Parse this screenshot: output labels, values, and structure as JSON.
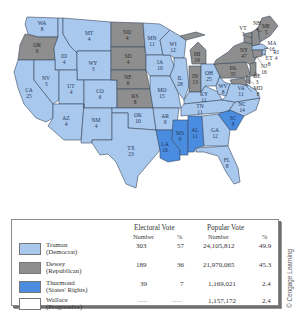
{
  "colors": {
    "truman": "#a8c8ee",
    "dewey": "#8e8e8e",
    "thurmond": "#4a8ce0",
    "wallace": "#ffffff",
    "border": "#3a4a5e"
  },
  "states": [
    {
      "abbr": "WA",
      "ev": "8",
      "party": "truman"
    },
    {
      "abbr": "OR",
      "ev": "6",
      "party": "dewey"
    },
    {
      "abbr": "CA",
      "ev": "25",
      "party": "truman"
    },
    {
      "abbr": "ID",
      "ev": "4",
      "party": "truman"
    },
    {
      "abbr": "NV",
      "ev": "3",
      "party": "truman"
    },
    {
      "abbr": "MT",
      "ev": "4",
      "party": "truman"
    },
    {
      "abbr": "WY",
      "ev": "3",
      "party": "truman"
    },
    {
      "abbr": "UT",
      "ev": "4",
      "party": "truman"
    },
    {
      "abbr": "AZ",
      "ev": "4",
      "party": "truman"
    },
    {
      "abbr": "CO",
      "ev": "6",
      "party": "truman"
    },
    {
      "abbr": "NM",
      "ev": "4",
      "party": "truman"
    },
    {
      "abbr": "ND",
      "ev": "4",
      "party": "dewey"
    },
    {
      "abbr": "SD",
      "ev": "4",
      "party": "dewey"
    },
    {
      "abbr": "NE",
      "ev": "6",
      "party": "dewey"
    },
    {
      "abbr": "KS",
      "ev": "8",
      "party": "dewey"
    },
    {
      "abbr": "OK",
      "ev": "10",
      "party": "truman"
    },
    {
      "abbr": "TX",
      "ev": "23",
      "party": "truman"
    },
    {
      "abbr": "MN",
      "ev": "11",
      "party": "truman"
    },
    {
      "abbr": "IA",
      "ev": "10",
      "party": "truman"
    },
    {
      "abbr": "MO",
      "ev": "15",
      "party": "truman"
    },
    {
      "abbr": "AR",
      "ev": "9",
      "party": "truman"
    },
    {
      "abbr": "LA",
      "ev": "10",
      "party": "thurmond"
    },
    {
      "abbr": "WI",
      "ev": "12",
      "party": "truman"
    },
    {
      "abbr": "IL",
      "ev": "28",
      "party": "truman"
    },
    {
      "abbr": "MS",
      "ev": "9",
      "party": "thurmond"
    },
    {
      "abbr": "MI",
      "ev": "19",
      "party": "dewey"
    },
    {
      "abbr": "IN",
      "ev": "13",
      "party": "dewey"
    },
    {
      "abbr": "KY",
      "ev": "11",
      "party": "truman"
    },
    {
      "abbr": "TN",
      "ev": "11",
      "party": "truman"
    },
    {
      "abbr": "AL",
      "ev": "11",
      "party": "thurmond"
    },
    {
      "abbr": "OH",
      "ev": "25",
      "party": "truman"
    },
    {
      "abbr": "WV",
      "ev": "8",
      "party": "truman"
    },
    {
      "abbr": "GA",
      "ev": "12",
      "party": "truman"
    },
    {
      "abbr": "FL",
      "ev": "8",
      "party": "truman"
    },
    {
      "abbr": "SC",
      "ev": "8",
      "party": "thurmond"
    },
    {
      "abbr": "NC",
      "ev": "14",
      "party": "truman"
    },
    {
      "abbr": "VA",
      "ev": "11",
      "party": "truman"
    },
    {
      "abbr": "PA",
      "ev": "35",
      "party": "dewey"
    },
    {
      "abbr": "NY",
      "ev": "47",
      "party": "dewey"
    },
    {
      "abbr": "VT",
      "ev": "3",
      "party": "dewey"
    },
    {
      "abbr": "NH",
      "ev": "4",
      "party": "dewey"
    },
    {
      "abbr": "ME",
      "ev": "5",
      "party": "dewey"
    },
    {
      "abbr": "MA",
      "ev": "16",
      "party": "truman"
    },
    {
      "abbr": "RI",
      "ev": "4",
      "party": "truman"
    },
    {
      "abbr": "CT",
      "ev": "8",
      "party": "dewey"
    },
    {
      "abbr": "NJ",
      "ev": "16",
      "party": "dewey"
    },
    {
      "abbr": "DE",
      "ev": "3",
      "party": "dewey"
    },
    {
      "abbr": "MD",
      "ev": "8",
      "party": "dewey"
    }
  ],
  "legend": {
    "header_electoral": "Electoral Vote",
    "header_popular": "Popular Vote",
    "sub_number": "Number",
    "sub_percent": "%",
    "rows": [
      {
        "name": "Truman",
        "party": "(Democrat)",
        "ev_number": "303",
        "ev_percent": "57",
        "pop_number": "24,105,812",
        "pop_percent": "49.9"
      },
      {
        "name": "Dewey",
        "party": "(Republican)",
        "ev_number": "189",
        "ev_percent": "36",
        "pop_number": "21,970,065",
        "pop_percent": "45.3"
      },
      {
        "name": "Thurmond",
        "party": "(States' Rights)",
        "ev_number": "39",
        "ev_percent": "7",
        "pop_number": "1,169,021",
        "pop_percent": "2.4"
      },
      {
        "name": "Wallace",
        "party": "(Progressive)",
        "ev_number": "----",
        "ev_percent": "----",
        "pop_number": "1,157,172",
        "pop_percent": "2.4"
      }
    ]
  },
  "credit": "© Cengage Learning"
}
